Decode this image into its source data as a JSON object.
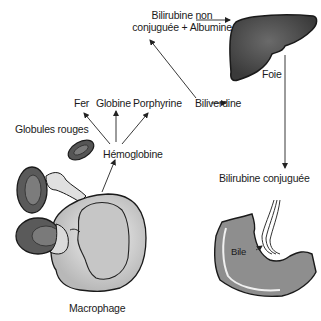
{
  "diagram": {
    "type": "flow",
    "nodes": {
      "bilirubine_non_conjuguee": {
        "line1": "Bilirubine non",
        "line2": "conjuguée + Albumine"
      },
      "foie": "Foie",
      "fer": "Fer",
      "globine": "Globine",
      "porphyrine": "Porphyrine",
      "biliverdine": "Biliverdine",
      "globules_rouges": "Globules rouges",
      "hemoglobine": "Hémoglobine",
      "bilirubine_conjuguee": "Bilirubine conjuguée",
      "bile": "Bile",
      "macrophage": "Macrophage"
    },
    "edges": [
      {
        "from": "Hémoglobine",
        "to": "Fer"
      },
      {
        "from": "Hémoglobine",
        "to": "Globine"
      },
      {
        "from": "Hémoglobine",
        "to": "Porphyrine"
      },
      {
        "from": "Porphyrine",
        "to": "Biliverdine"
      },
      {
        "from": "Biliverdine",
        "to": "Bilirubine non conjuguée + Albumine"
      },
      {
        "from": "Bilirubine non conjuguée + Albumine",
        "to": "Foie"
      },
      {
        "from": "Foie",
        "to": "Bilirubine conjuguée"
      },
      {
        "from": "Macrophage",
        "to": "Hémoglobine"
      },
      {
        "from": "Bile",
        "to": "Intestin (illustration)"
      }
    ],
    "colors": {
      "liver": "#4a4a4a",
      "rbc": "#5a5a5a",
      "macrophage": "#d4d4d4",
      "intestine": "#8a8a8a",
      "line": "#222222"
    }
  }
}
